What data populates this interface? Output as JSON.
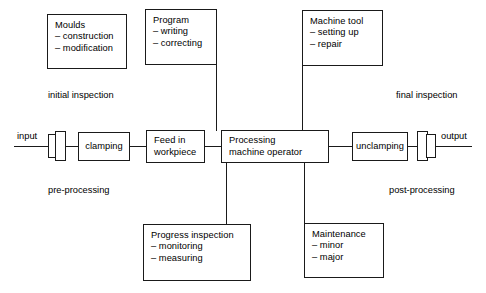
{
  "diagram": {
    "background_color": "#ffffff",
    "stroke_color": "#1a1a1a",
    "boxes": {
      "moulds": {
        "text": "Moulds\n– construction\n– modification"
      },
      "program": {
        "text": "Program\n– writing\n– correcting"
      },
      "machine_tool": {
        "text": "Machine tool\n– setting up\n– repair"
      },
      "clamping": {
        "text": "clamping"
      },
      "feed_in_workpiece": {
        "text": "Feed in\nworkpiece"
      },
      "processing_machine_operator": {
        "text": "Processing\nmachine operator"
      },
      "unclamping": {
        "text": "unclamping"
      },
      "progress_inspection": {
        "text": "Progress inspection\n– monitoring\n– measuring"
      },
      "maintenance": {
        "text": "Maintenance\n– minor\n– major"
      }
    },
    "labels": {
      "initial_inspection": "initial inspection",
      "final_inspection": "final inspection",
      "pre_processing": "pre-processing",
      "post_processing": "post-processing",
      "input": "input",
      "output": "output"
    }
  }
}
